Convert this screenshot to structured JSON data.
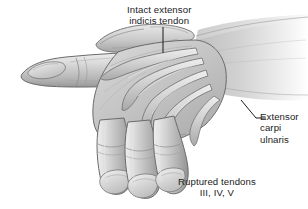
{
  "figure": {
    "background_color": "#ffffff",
    "ink_color": "#1b1b1b"
  },
  "labels": {
    "intact_tendon": {
      "line1": "Intact extensor",
      "line2": "indicis tendon",
      "leader": "vertical-leader-line"
    },
    "extensor_carpi_ulnaris": {
      "line1": "Extensor",
      "line2": "carpi",
      "line3": "ulnaris",
      "leader": "diagonal-leader-line"
    },
    "ruptured_tendons": {
      "line1": "Ruptured tendons",
      "line2": "III, IV, V"
    }
  },
  "anatomy": {
    "parts": [
      "thumb",
      "index-finger-extended",
      "middle-finger-drooped",
      "ring-finger-drooped",
      "little-finger-drooped",
      "dorsum-of-hand",
      "extensor-tendons",
      "forearm"
    ],
    "tone_light": "#e4e4e4",
    "tone_mid": "#bdbdbd",
    "tone_dark": "#8f8f8f",
    "outline": "#5a5a5a"
  }
}
